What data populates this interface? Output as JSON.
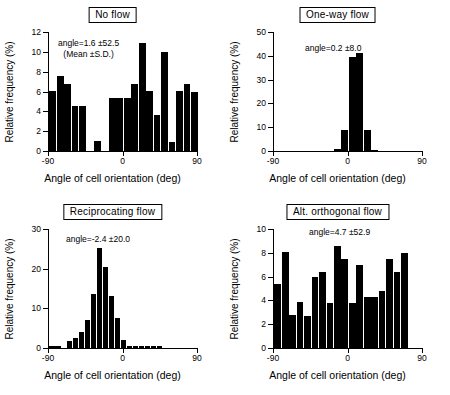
{
  "figure": {
    "axis_title_x": "Angle of cell orientation (deg)",
    "axis_title_y": "Relative frequency (%)",
    "ink_color": "#000000",
    "background": "#ffffff"
  },
  "chart_data": [
    {
      "type": "bar",
      "panel_id": "no-flow",
      "title": "No flow",
      "annotation": "angle=1.6 ±52.5",
      "annotation_note": "(Mean ±S.D.)",
      "xlabel": "Angle of cell orientation (deg)",
      "ylabel": "Relative frequency (%)",
      "xlim": [
        -90,
        90
      ],
      "ylim": [
        0,
        12
      ],
      "yticks": [
        0,
        2,
        4,
        6,
        8,
        10,
        12
      ],
      "xticks": [
        -90,
        0,
        90
      ],
      "xticklabels": [
        "-90",
        "0",
        "90"
      ],
      "grid": false,
      "bin_width_deg": 9,
      "categories": [
        "-90",
        "-81",
        "-72",
        "-63",
        "-54",
        "-45",
        "-36",
        "-27",
        "-18",
        "-9",
        "0",
        "9",
        "18",
        "27",
        "36",
        "45",
        "54",
        "63",
        "72",
        "81"
      ],
      "values": [
        6.1,
        7.6,
        6.8,
        4.5,
        4.5,
        0.0,
        1.0,
        0.0,
        5.3,
        5.3,
        5.3,
        6.8,
        10.9,
        6.1,
        3.6,
        10.0,
        0.9,
        6.1,
        6.8,
        6.0
      ]
    },
    {
      "type": "bar",
      "panel_id": "one-way-flow",
      "title": "One-way flow",
      "annotation": "angle=0.2 ±8.0",
      "annotation_note": "",
      "xlabel": "Angle of cell orientation (deg)",
      "ylabel": "Relative frequency (%)",
      "xlim": [
        -90,
        90
      ],
      "ylim": [
        0,
        50
      ],
      "yticks": [
        0,
        10,
        20,
        30,
        40,
        50
      ],
      "xticks": [
        -90,
        0,
        90
      ],
      "xticklabels": [
        "-90",
        "0",
        "90"
      ],
      "grid": false,
      "bin_width_deg": 9,
      "categories": [
        "-90",
        "-81",
        "-72",
        "-63",
        "-54",
        "-45",
        "-36",
        "-27",
        "-18",
        "-9",
        "0",
        "9",
        "18",
        "27",
        "36",
        "45",
        "54",
        "63",
        "72",
        "81"
      ],
      "values": [
        0.0,
        0.0,
        0.0,
        0.0,
        0.0,
        0.0,
        0.0,
        0.0,
        0.7,
        9.0,
        39.6,
        41.2,
        9.0,
        0.6,
        0.0,
        0.0,
        0.0,
        0.0,
        0.0,
        0.0
      ]
    },
    {
      "type": "bar",
      "panel_id": "reciprocating-flow",
      "title": "Reciprocating flow",
      "annotation": "angle=-2.4 ±20.0",
      "annotation_note": "",
      "xlabel": "Angle of cell orientation (deg)",
      "ylabel": "Relative frequency (%)",
      "xlim": [
        -90,
        90
      ],
      "ylim": [
        0,
        30
      ],
      "yticks": [
        0,
        10,
        20,
        30
      ],
      "xticks": [
        -90,
        0,
        90
      ],
      "xticklabels": [
        "-90",
        "0",
        "90"
      ],
      "grid": false,
      "bin_width_deg": 7.2,
      "categories": [
        "-90",
        "-82.8",
        "-75.6",
        "-68.4",
        "-61.2",
        "-54",
        "-46.8",
        "-39.6",
        "-32.4",
        "-25.2",
        "-18",
        "-10.8",
        "-3.6",
        "3.6",
        "10.8",
        "18",
        "25.2",
        "32.4",
        "39.6",
        "46.8",
        "54",
        "61.2",
        "68.4",
        "75.6",
        "82.8"
      ],
      "values": [
        0.6,
        0.6,
        0.0,
        1.7,
        2.6,
        4.0,
        7.0,
        13.5,
        25.2,
        20.5,
        13.0,
        7.6,
        2.0,
        0.4,
        0.4,
        0.4,
        0.4,
        0.5,
        0.5,
        0.0,
        0.0,
        0.0,
        0.0,
        0.0,
        0.0
      ],
      "values_note": "Left-to-right bin sequence as drawn"
    },
    {
      "type": "bar",
      "panel_id": "alt-orthogonal-flow",
      "title": "Alt. orthogonal flow",
      "annotation": "angle=4.7 ±52.9",
      "annotation_note": "",
      "xlabel": "Angle of cell orientation (deg)",
      "ylabel": "Relative frequency (%)",
      "xlim": [
        -90,
        90
      ],
      "ylim": [
        0,
        10
      ],
      "yticks": [
        0,
        2,
        4,
        6,
        8,
        10
      ],
      "xticks": [
        -90,
        0,
        90
      ],
      "xticklabels": [
        "-90",
        "0",
        "90"
      ],
      "grid": false,
      "bin_width_deg": 9,
      "categories": [
        "-90",
        "-81",
        "-72",
        "-63",
        "-54",
        "-45",
        "-36",
        "-27",
        "-18",
        "-9",
        "0",
        "9",
        "18",
        "27",
        "36",
        "45",
        "54",
        "63",
        "72",
        "81"
      ],
      "values": [
        5.4,
        8.05,
        2.75,
        3.85,
        2.7,
        5.95,
        6.4,
        3.8,
        8.55,
        7.5,
        3.8,
        6.95,
        4.25,
        4.25,
        4.8,
        7.5,
        6.35,
        7.95,
        0.0,
        0.0
      ]
    }
  ]
}
